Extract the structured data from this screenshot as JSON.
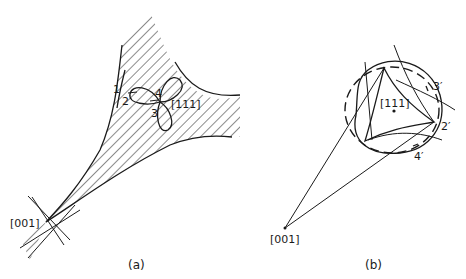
{
  "figure": {
    "panel_a": {
      "caption": "(a)",
      "labels": {
        "pole_001": "[001]",
        "pole_111": "[111]",
        "p1": "1",
        "p2": "2",
        "p3": "3",
        "p4": "4"
      }
    },
    "panel_b": {
      "caption": "(b)",
      "labels": {
        "pole_001": "[001]",
        "pole_111": "[111]",
        "p2": "2′",
        "p3": "3′",
        "p4": "4′"
      }
    },
    "colors": {
      "ink": "#1a1a1a",
      "background": "#ffffff"
    }
  }
}
